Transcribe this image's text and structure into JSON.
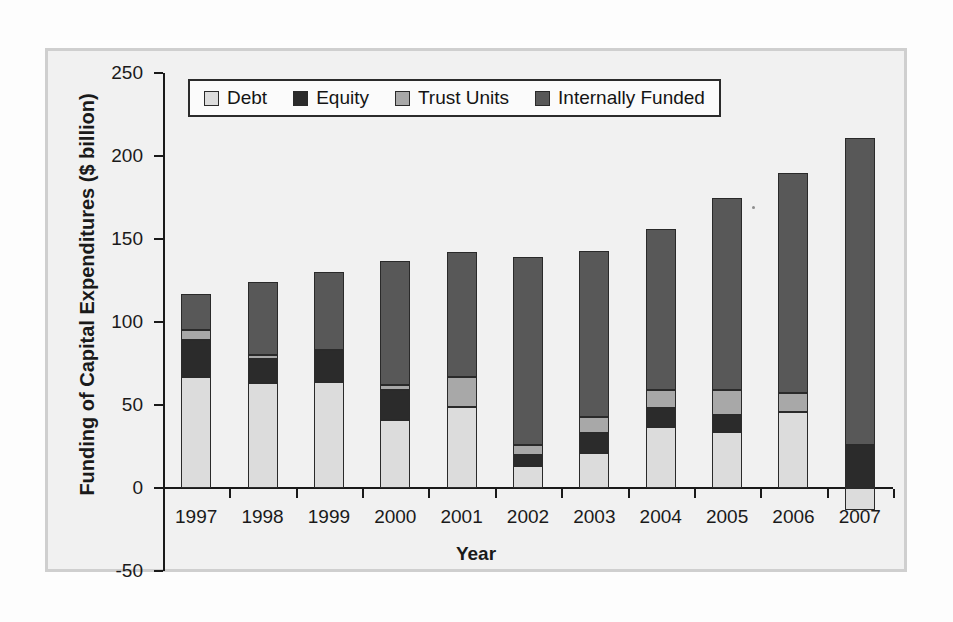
{
  "figure": {
    "frame_color": "#cfcfcf",
    "plot_background": "#f1f1f1"
  },
  "legend": {
    "position": "top-center-inside",
    "items": [
      {
        "label": "Debt",
        "color": "#dcdcdc"
      },
      {
        "label": "Equity",
        "color": "#2b2b2b"
      },
      {
        "label": "Trust Units",
        "color": "#a8a8a8"
      },
      {
        "label": "Internally Funded",
        "color": "#585858"
      }
    ]
  },
  "chart_data": {
    "type": "bar",
    "subtype": "stacked-vertical",
    "title": "",
    "xlabel": "Year",
    "ylabel": "Funding of Capital Expenditures ($ billion)",
    "ylim": [
      -50,
      250
    ],
    "yticks": [
      -50,
      0,
      50,
      100,
      150,
      200,
      250
    ],
    "ytick_labels": [
      "-50",
      "0",
      "50",
      "100",
      "150",
      "200",
      "250"
    ],
    "grid": false,
    "categories": [
      "1997",
      "1998",
      "1999",
      "2000",
      "2001",
      "2002",
      "2003",
      "2004",
      "2005",
      "2006",
      "2007"
    ],
    "series": [
      {
        "name": "Debt",
        "color": "#dcdcdc",
        "values": [
          67,
          63,
          64,
          41,
          49,
          13,
          21,
          37,
          34,
          46,
          -13
        ]
      },
      {
        "name": "Equity",
        "color": "#2b2b2b",
        "values": [
          22,
          15,
          19,
          18,
          0,
          7,
          12,
          11,
          10,
          0,
          26
        ]
      },
      {
        "name": "Trust Units",
        "color": "#a8a8a8",
        "values": [
          6,
          2,
          0,
          3,
          18,
          6,
          10,
          11,
          15,
          11,
          0
        ]
      },
      {
        "name": "Internally Funded",
        "color": "#585858",
        "values": [
          22,
          44,
          47,
          75,
          75,
          113,
          100,
          97,
          116,
          133,
          185
        ]
      }
    ],
    "totals": [
      117,
      124,
      130,
      137,
      142,
      139,
      143,
      156,
      175,
      190,
      211
    ]
  }
}
